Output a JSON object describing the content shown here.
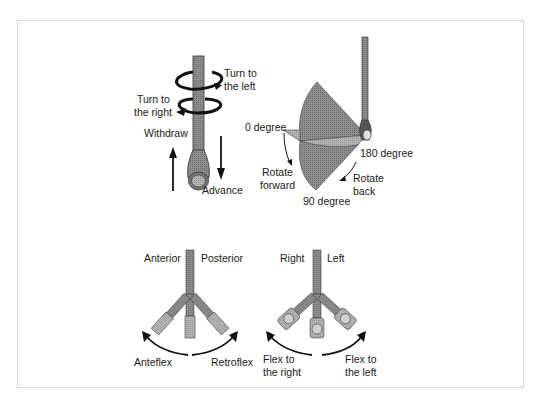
{
  "diagram": {
    "panel_shaft": {
      "labels": {
        "turn_left": [
          "Turn to",
          "the left"
        ],
        "turn_right": [
          "Turn to",
          "the right"
        ],
        "withdraw": "Withdraw",
        "advance": "Advance"
      }
    },
    "panel_rotation": {
      "labels": {
        "zero": "0 degree",
        "ninety": "90 degree",
        "one_eighty": "180 degree",
        "rotate_forward": [
          "Rotate",
          "forward"
        ],
        "rotate_back": [
          "Rotate",
          "back"
        ]
      }
    },
    "panel_anteflex": {
      "labels": {
        "anterior": "Anterior",
        "posterior": "Posterior",
        "anteflex": "Anteflex",
        "retroflex": "Retroflex"
      }
    },
    "panel_lateral": {
      "labels": {
        "right": "Right",
        "left": "Left",
        "flex_right": [
          "Flex to",
          "the right"
        ],
        "flex_left": [
          "Flex to",
          "the left"
        ]
      }
    },
    "colors": {
      "shaft": "#8a8a8a",
      "shaft_dark": "#555555",
      "fan": "#9a9a9a",
      "fan_light": "#bdbdbd",
      "frame": "#d8d8d8",
      "text": "#1a1a1a"
    }
  }
}
